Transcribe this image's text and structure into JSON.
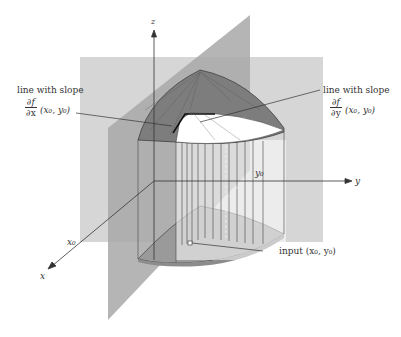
{
  "diagram": {
    "axes": {
      "z": "z",
      "y": "y",
      "x": "x"
    },
    "ticks": {
      "x0": "x₀",
      "y0": "y₀"
    },
    "annotations": {
      "left": {
        "line1": "line with slope",
        "num": "∂f",
        "den": "∂x",
        "point": "(x₀, y₀)"
      },
      "right": {
        "line1": "line with slope",
        "num": "∂f",
        "den": "∂y",
        "point": "(x₀, y₀)"
      },
      "input": "input (x₀, y₀)"
    },
    "colors": {
      "plane_yz": "#d4d4d4",
      "plane_xz": "#a9a9a9",
      "surface": "#8a8a8a",
      "base": "#9a9a9a",
      "lines": "#333333"
    }
  }
}
